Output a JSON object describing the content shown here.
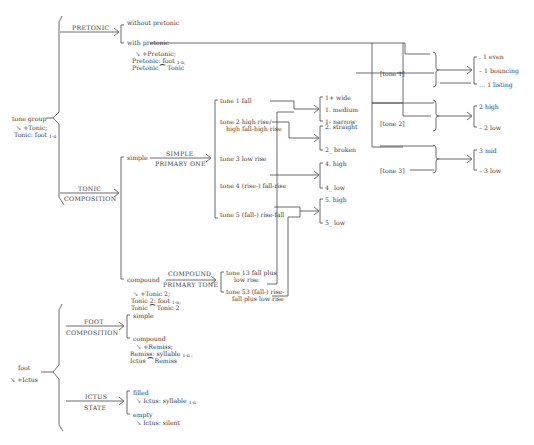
{
  "tone_group": {
    "root": "tone group",
    "root_rule": [
      "↘ +Tonic;",
      "Tonic: foot"
    ],
    "root_rule_sub": "1-n",
    "pretonic_system": "PRETONIC",
    "without_pretonic": "without pretonic",
    "with_pretonic": "with pretonic",
    "pretonic_rule": [
      "↘ +Pretonic;",
      "Pretonic: foot",
      "Pretonic ⁀ Tonic"
    ],
    "pretonic_rule_sub": "1-n;",
    "tonic_system": [
      "TONIC",
      "COMPOSITION"
    ],
    "simple": "simple",
    "simple_system": [
      "SIMPLE",
      "PRIMARY ONE"
    ],
    "compound": "compound",
    "compound_system": [
      "COMPOUND",
      "PRIMARY TONE"
    ],
    "compound_rule": [
      "↘ +Tonic 2;",
      "Tonic 2: foot",
      "Tonic ⁀ Tonic 2"
    ],
    "compound_rule_sub": "1-n;",
    "simple_tones": [
      "tone 1 fall",
      "tone 2 high rise/",
      "high fall-high rise",
      "tone 3 low rise",
      "tone 4    (rise-) fall-rise",
      "tone 5    (fall-) rise-fall"
    ],
    "compound_tones": [
      "tone 13  fall plus",
      "low rise",
      "tone 53  (fall-) rise-",
      "fall plus low rise"
    ],
    "secondary": {
      "tone1": [
        "1+ wide",
        "1. medium",
        "1- narrow"
      ],
      "tone2": [
        "2. straight",
        "2_ broken"
      ],
      "tone4": [
        "4. high",
        "4_ low"
      ],
      "tone5": [
        "5. high",
        "5_ low"
      ]
    },
    "pretonic_labels": [
      "[tone 1]",
      "[tone 2]",
      "[tone 3]"
    ],
    "pretonic_options": {
      "tone1": [
        ". 1 even",
        "– 1 bouncing",
        "… 1 listing"
      ],
      "tone2": [
        "2 high",
        "– 2 low"
      ],
      "tone3": [
        "3 mid",
        "– 3 low"
      ]
    }
  },
  "foot": {
    "root": "foot",
    "root_rule": "↘ +Ictus",
    "composition_system": [
      "FOOT",
      "COMPOSITION"
    ],
    "simple": "simple",
    "compound": "compound",
    "compound_rule": [
      "↘ +Remiss;",
      "Remiss: syllable",
      "Ictus ⁀ Remiss"
    ],
    "compound_rule_sub": "1-n ;",
    "ictus_system": [
      "ICTUS",
      "STATE"
    ],
    "filled": "filled",
    "filled_rule": "↘ Ictus: syllable",
    "filled_rule_sub": "1-n",
    "empty": "empty",
    "empty_rule": "↘ Ictus: silent"
  }
}
